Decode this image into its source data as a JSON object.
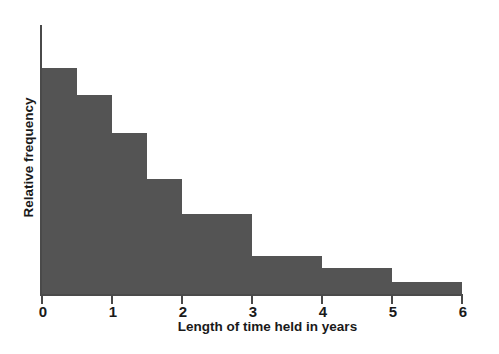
{
  "chart_data": {
    "type": "bar",
    "title": "",
    "subtitle": "",
    "xlabel": "Length of time held in years",
    "ylabel": "Relative frequency",
    "xlim": [
      0,
      6
    ],
    "ylim": [
      0,
      1.0
    ],
    "xticks": [
      "0",
      "1",
      "2",
      "3",
      "4",
      "5",
      "6"
    ],
    "xtick_values": [
      0,
      1,
      2,
      3,
      4,
      5,
      6
    ],
    "yticks": [],
    "grid": false,
    "legend": null,
    "bar_color": "#545454",
    "axis_color": "#4a4a4a",
    "text_color": "#1a1a1a",
    "background": "#ffffff",
    "annotations": [],
    "bins": [
      {
        "label": "0-0.5",
        "x_start": 0.0,
        "x_end": 0.5,
        "value": 0.84
      },
      {
        "label": "0.5-1",
        "x_start": 0.5,
        "x_end": 1.0,
        "value": 0.74
      },
      {
        "label": "1-1.5",
        "x_start": 1.0,
        "x_end": 1.5,
        "value": 0.6
      },
      {
        "label": "1.5-2",
        "x_start": 1.5,
        "x_end": 2.0,
        "value": 0.43
      },
      {
        "label": "2-3",
        "x_start": 2.0,
        "x_end": 3.0,
        "value": 0.3
      },
      {
        "label": "3-4",
        "x_start": 3.0,
        "x_end": 4.0,
        "value": 0.145
      },
      {
        "label": "4-5",
        "x_start": 4.0,
        "x_end": 5.0,
        "value": 0.1
      },
      {
        "label": "5-6",
        "x_start": 5.0,
        "x_end": 6.0,
        "value": 0.048
      }
    ]
  }
}
